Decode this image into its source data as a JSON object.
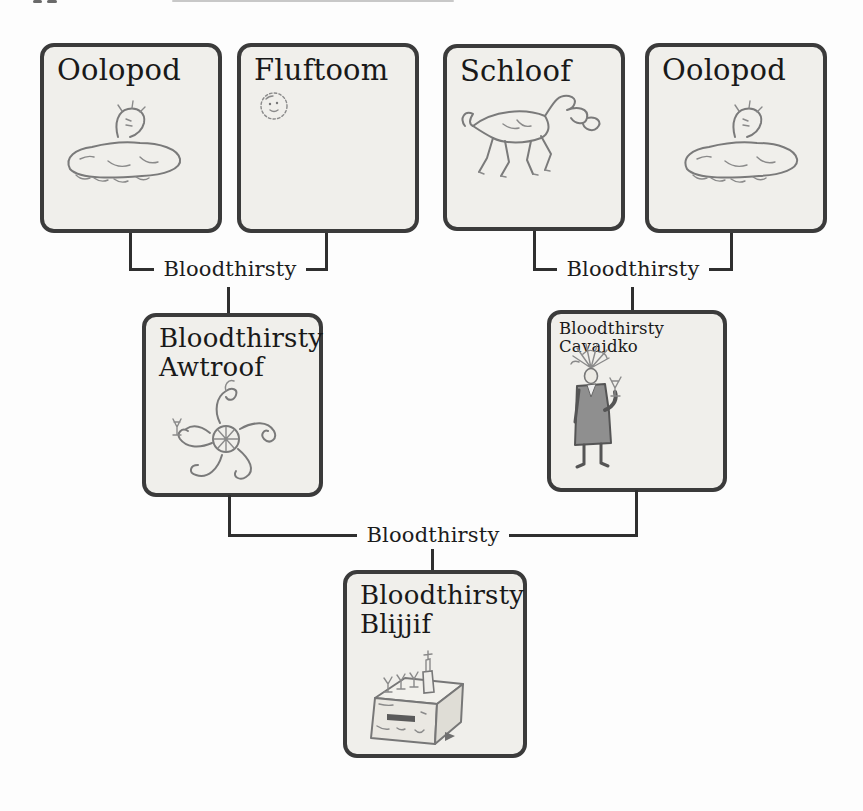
{
  "figure": {
    "kind": "creature-family-tree",
    "boxes": {
      "oolopod1": {
        "label": "Oolopod"
      },
      "fluftoom": {
        "label": "Fluftoom"
      },
      "schloof": {
        "label": "Schloof"
      },
      "oolopod2": {
        "label": "Oolopod"
      },
      "awtroof": {
        "label_line1": "Bloodthirsty",
        "label_line2": "Awtroof"
      },
      "cavaidko": {
        "label": "Bloodthirsty Cavaidko"
      },
      "blijjif": {
        "label_line1": "Bloodthirsty",
        "label_line2": "Blijjif"
      }
    },
    "connectors": {
      "pair1": {
        "label": "Bloodthirsty"
      },
      "pair2": {
        "label": "Bloodthirsty"
      },
      "pair3": {
        "label": "Bloodthirsty"
      }
    },
    "relationships": [
      {
        "parents": [
          "Oolopod",
          "Fluftoom"
        ],
        "relation": "Bloodthirsty",
        "offspring": "Bloodthirsty Awtroof"
      },
      {
        "parents": [
          "Schloof",
          "Oolopod"
        ],
        "relation": "Bloodthirsty",
        "offspring": "Bloodthirsty Cavaidko"
      },
      {
        "parents": [
          "Bloodthirsty Awtroof",
          "Bloodthirsty Cavaidko"
        ],
        "relation": "Bloodthirsty",
        "offspring": "Bloodthirsty Blijjif"
      }
    ],
    "icons": {
      "oolopod1": "oolopod-creature-icon",
      "fluftoom": "fluftoom-creature-icon",
      "schloof": "schloof-creature-icon",
      "awtroof": "awtroof-creature-icon",
      "cavaidko": "cavaidko-creature-icon",
      "blijjif": "blijjif-creature-icon"
    },
    "colors": {
      "page_background": "#fdfdfd",
      "box_fill": "#f0efeb",
      "box_border": "#3b3b3b",
      "connector_line": "#2f2f2f",
      "sketch_stroke": "#7a7a7a",
      "label_text": "#191919"
    }
  }
}
